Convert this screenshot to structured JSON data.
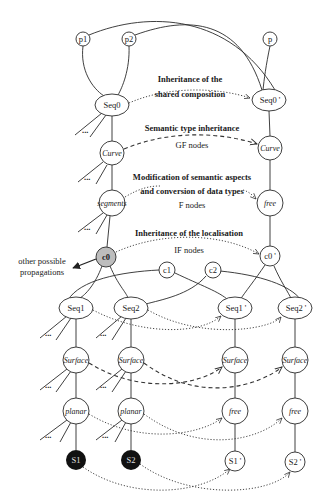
{
  "diagram": {
    "top_nodes": {
      "p1": "p1",
      "p2": "p2",
      "p": "p"
    },
    "left": {
      "seq0": "Seq0",
      "curve": "Curve",
      "segments": "segments",
      "c0": "c0",
      "c1": "c1",
      "c2": "c2",
      "seq1": "Seq1",
      "seq2": "Seq2",
      "surface1": "Surface",
      "surface2": "Surface",
      "planar1": "planar",
      "planar2": "planar",
      "s1": "S1",
      "s2": "S2"
    },
    "right": {
      "seq0": "Seq0 '",
      "curve": "Curve",
      "free": "free",
      "c0": "c0 '",
      "seq1": "Seq1 '",
      "seq2": "Seq2 '",
      "surface1": "Surface",
      "surface2": "Surface",
      "free1": "free",
      "free2": "free",
      "s1": "S1 '",
      "s2": "S2 '"
    },
    "ellipsis": "...",
    "annotations": {
      "shared_line1": "Inheritance of the",
      "shared_line2": "shared composition",
      "semantic_type": "Semantic type inheritance",
      "gf_nodes": "GF nodes",
      "modification_line1": "Modification of semantic aspects",
      "modification_line2": "and conversion of data types",
      "f_nodes": "F nodes",
      "localisation": "Inheritance of the localisation",
      "if_nodes": "IF nodes",
      "other_line1": "other possible",
      "other_line2": "propagations"
    },
    "colors": {
      "line": "#2a2a2a",
      "c0_fill": "#bdbdbd",
      "s_fill": "#111111",
      "background": "#ffffff"
    }
  }
}
